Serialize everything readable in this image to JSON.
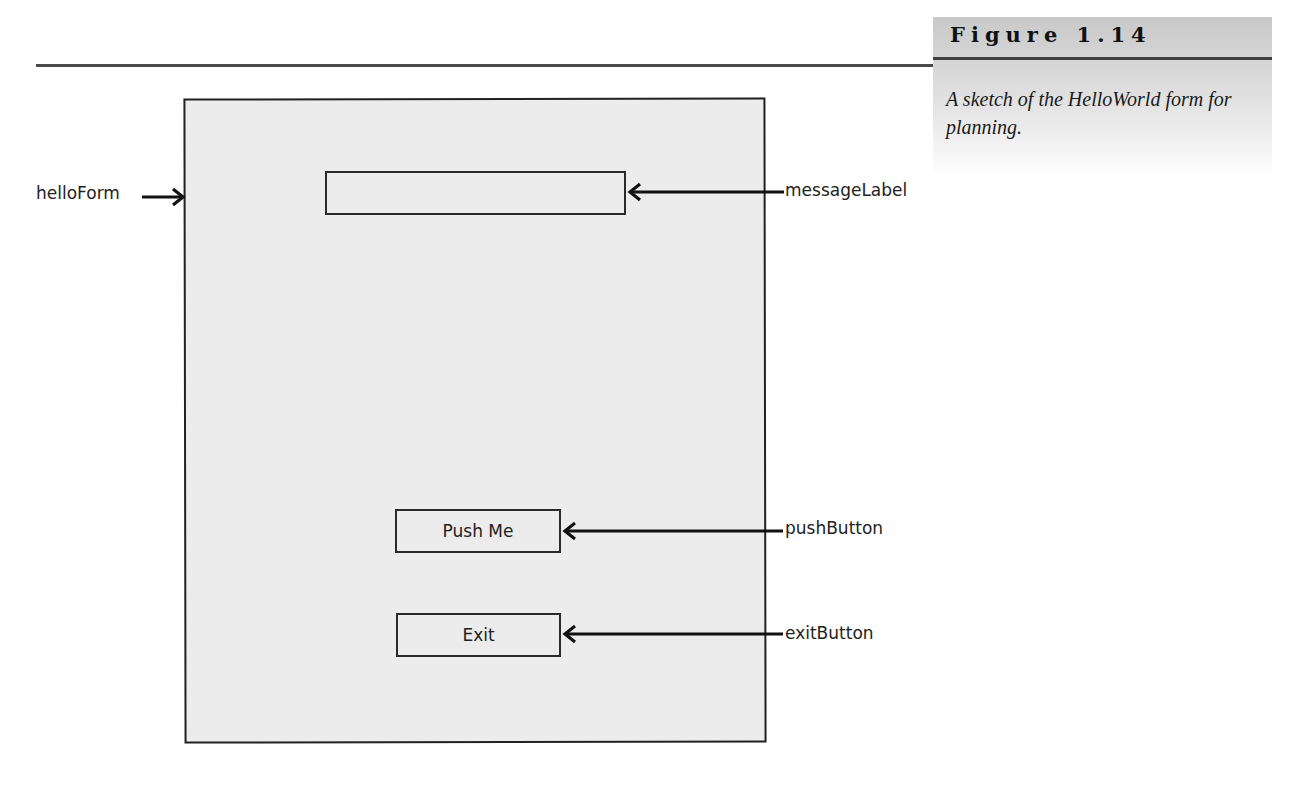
{
  "figure": {
    "title": "Figure 1.14",
    "caption": "A sketch of the HelloWorld form for planning."
  },
  "sketch": {
    "form": {
      "name": "helloForm"
    },
    "controls": [
      {
        "name": "messageLabel",
        "text": ""
      },
      {
        "name": "pushButton",
        "text": "Push Me"
      },
      {
        "name": "exitButton",
        "text": "Exit"
      }
    ]
  },
  "colors": {
    "form_fill": "#ececec",
    "line": "#222222",
    "caption_panel": "#c9c9c9"
  }
}
